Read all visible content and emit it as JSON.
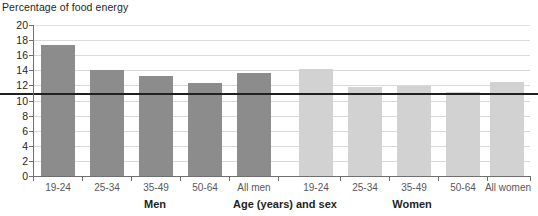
{
  "chart_data": {
    "type": "bar",
    "title": "",
    "ylabel": "Percentage of food energy",
    "xlabel": "Age (years) and sex",
    "ylim": [
      0,
      20
    ],
    "ytick_step": 2,
    "yticks": [
      "20",
      "18",
      "16",
      "14",
      "12",
      "10",
      "8",
      "6",
      "4",
      "2",
      "0"
    ],
    "grid": true,
    "legend": "none",
    "categories": [
      "19-24",
      "25-34",
      "35-49",
      "50-64",
      "All men",
      "19-24",
      "25-34",
      "35-49",
      "50-64",
      "All women"
    ],
    "series": [
      {
        "name": "Men",
        "color": "#8c8c8c",
        "points": [
          {
            "label": "19-24",
            "value": 17.4
          },
          {
            "label": "25-34",
            "value": 14.0
          },
          {
            "label": "35-49",
            "value": 13.2
          },
          {
            "label": "50-64",
            "value": 12.3
          },
          {
            "label": "All men",
            "value": 13.7
          }
        ]
      },
      {
        "name": "Women",
        "color": "#d2d2d2",
        "points": [
          {
            "label": "19-24",
            "value": 14.2
          },
          {
            "label": "25-34",
            "value": 11.8
          },
          {
            "label": "35-49",
            "value": 11.9
          },
          {
            "label": "50-64",
            "value": 11.1
          },
          {
            "label": "All women",
            "value": 12.5
          }
        ]
      }
    ],
    "reference_line": {
      "value": 11.0,
      "color": "#231f20",
      "label": ""
    },
    "group_labels": [
      "Men",
      "Age (years) and sex",
      "Women"
    ],
    "colors": {
      "men_bar": "#8c8c8c",
      "women_bar": "#d2d2d2",
      "gridline": "#d9d9db",
      "axis": "#6f6f72",
      "reference_line": "#231f20",
      "text": "#231f20",
      "tick_text": "#58585b",
      "background": "#ffffff"
    }
  }
}
